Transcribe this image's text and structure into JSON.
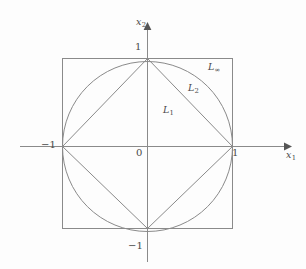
{
  "figure": {
    "kind": "unit-ball-norms-diagram",
    "background_color": "#fdfdfd",
    "stroke_color": "#8a8a8a",
    "text_color": "#4a4a4a"
  },
  "axes": {
    "x_label": "x",
    "x_subscript": "1",
    "y_label": "x",
    "y_subscript": "2",
    "origin_label": "0",
    "x_ticks": [
      {
        "label": "−1",
        "value": -1
      },
      {
        "label": "1",
        "value": 1
      }
    ],
    "y_ticks": [
      {
        "label": "1",
        "value": 1
      },
      {
        "label": "−1",
        "value": -1
      }
    ]
  },
  "curves": [
    {
      "name": "L1",
      "label": "L",
      "subscript": "1",
      "shape": "diamond",
      "description": "unit ball of the L1 norm: |x1| + |x2| = 1",
      "vertices": [
        [
          1,
          0
        ],
        [
          0,
          1
        ],
        [
          -1,
          0
        ],
        [
          0,
          -1
        ]
      ]
    },
    {
      "name": "L2",
      "label": "L",
      "subscript": "2",
      "shape": "circle",
      "description": "unit ball of the L2 norm: x1^2 + x2^2 = 1",
      "radius": 1
    },
    {
      "name": "Linf",
      "label": "L",
      "subscript": "∞",
      "shape": "square",
      "description": "unit ball of the L-infinity norm: max(|x1|,|x2|) = 1",
      "vertices": [
        [
          1,
          1
        ],
        [
          -1,
          1
        ],
        [
          -1,
          -1
        ],
        [
          1,
          -1
        ]
      ]
    }
  ]
}
